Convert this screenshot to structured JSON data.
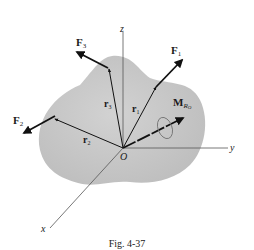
{
  "figure": {
    "caption": "Fig. 4-37",
    "body_color": "#c8c8c8",
    "vector_color": "#111111",
    "axis_color": "#555555"
  },
  "axes": {
    "x": "x",
    "y": "y",
    "z": "z",
    "origin": "O"
  },
  "forces": [
    {
      "label": "F",
      "sub": "1"
    },
    {
      "label": "F",
      "sub": "2"
    },
    {
      "label": "F",
      "sub": "3"
    }
  ],
  "position_vectors": [
    {
      "label": "r",
      "sub": "1"
    },
    {
      "label": "r",
      "sub": "2"
    },
    {
      "label": "r",
      "sub": "3"
    }
  ],
  "moment": {
    "label": "M",
    "sub": "R",
    "sub2": "O"
  }
}
